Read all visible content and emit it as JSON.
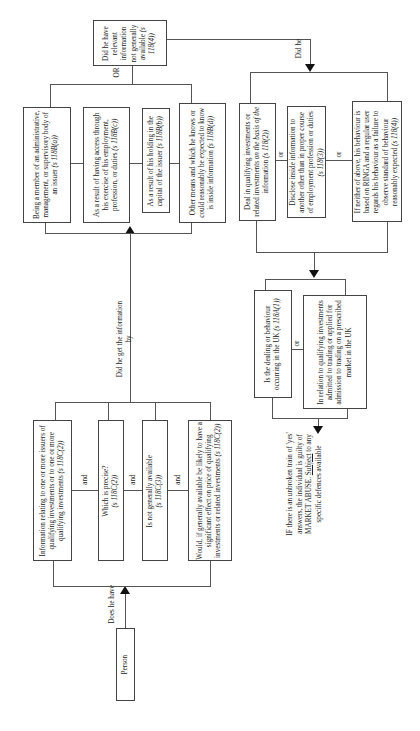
{
  "flowchart": {
    "start": {
      "label": "Person"
    },
    "edge_does_he_have": "Does he have",
    "group_information": {
      "connector": "and",
      "items": [
        {
          "text": "Information relating to one or more issuers of qualifying investments or to one or more qualifying investments",
          "ref": "(s 118C(2))"
        },
        {
          "text": "Which is precise?",
          "ref": "(s 118C(2))"
        },
        {
          "text": "Is not generally available",
          "ref": "(s 118C(3))"
        },
        {
          "text": "Would, if generally available be likely to have a significant effect on price of qualifying investments or related investments",
          "ref": "(s 118C(2))"
        }
      ]
    },
    "edge_did_he_get": "Did he get the information by",
    "group_means": {
      "items": [
        {
          "text": "Being a member of an administrative, management, or supervisory body of an issuer",
          "ref": "(s 118B(a))"
        },
        {
          "text": "As a result of having access through his exercise of his employment, profession, or duties",
          "ref": "(s 118B(c))"
        },
        {
          "text": "As a result of his holding in the capital of the issuer",
          "ref": "(s 118B(b))"
        },
        {
          "text": "Other means and which he knows or could reasonably be expected to know is inside information",
          "ref": "(s 118B(d))"
        }
      ]
    },
    "edge_or": "OR",
    "decision_relevant": {
      "text": "Did he have relevant information not generally available",
      "ref": "(s 118(4))"
    },
    "edge_did_he": "Did he",
    "group_behaviour": {
      "connector": "or",
      "items": [
        {
          "text_before": "Deal in qualifying investments or related investments ",
          "text_italic": "on the basis of the",
          "text_after": " information",
          "ref": "(s 118(2))"
        },
        {
          "text": "Disclose inside information to another other than in proper course of employment profession or duties",
          "ref": "(s 118(3))"
        },
        {
          "text": "If neither of above, his behaviour is based on RINGA and a regular user regards his behaviour as a failure to observe standard of behaviour reasonably expected",
          "ref": "(s 118(4))"
        }
      ]
    },
    "group_uk": {
      "connector": "or",
      "items": [
        {
          "text": "Is the dealing or behaviour occurring in the UK",
          "ref": "(s 118A(1))"
        },
        {
          "text": "In relation to qualifying investments admitted to trading or applied for admission to trading on a prescribed market in the UK",
          "ref": ""
        }
      ]
    },
    "conclusion": {
      "text_before": "IF there is an unbroken train of 'yes' answers, the individual is guilty of MARKET ABUSE. ",
      "underlined": "Subject",
      "text_after": " to any specific defences available"
    }
  }
}
